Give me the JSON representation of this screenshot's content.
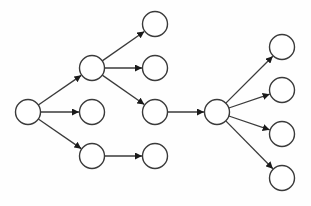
{
  "diagram": {
    "type": "directed-tree-graph",
    "colors": {
      "stroke": "#3a3a3a",
      "fill": "#ffffff",
      "background": "#fefefe"
    },
    "node_radius": 12.5,
    "nodes": [
      {
        "id": "n0",
        "x": 28,
        "y": 112
      },
      {
        "id": "n1",
        "x": 92,
        "y": 68
      },
      {
        "id": "n2",
        "x": 92,
        "y": 112
      },
      {
        "id": "n3",
        "x": 92,
        "y": 156
      },
      {
        "id": "n4",
        "x": 155,
        "y": 24
      },
      {
        "id": "n5",
        "x": 155,
        "y": 68
      },
      {
        "id": "n6",
        "x": 155,
        "y": 112
      },
      {
        "id": "n7",
        "x": 155,
        "y": 156
      },
      {
        "id": "n8",
        "x": 217,
        "y": 112
      },
      {
        "id": "n9",
        "x": 282,
        "y": 47
      },
      {
        "id": "n10",
        "x": 282,
        "y": 90
      },
      {
        "id": "n11",
        "x": 282,
        "y": 134
      },
      {
        "id": "n12",
        "x": 282,
        "y": 178
      }
    ],
    "edges": [
      {
        "from": "n0",
        "to": "n1"
      },
      {
        "from": "n0",
        "to": "n2"
      },
      {
        "from": "n0",
        "to": "n3"
      },
      {
        "from": "n1",
        "to": "n4"
      },
      {
        "from": "n1",
        "to": "n5"
      },
      {
        "from": "n1",
        "to": "n6"
      },
      {
        "from": "n3",
        "to": "n7"
      },
      {
        "from": "n6",
        "to": "n8"
      },
      {
        "from": "n8",
        "to": "n9"
      },
      {
        "from": "n8",
        "to": "n10"
      },
      {
        "from": "n8",
        "to": "n11"
      },
      {
        "from": "n8",
        "to": "n12"
      }
    ]
  }
}
